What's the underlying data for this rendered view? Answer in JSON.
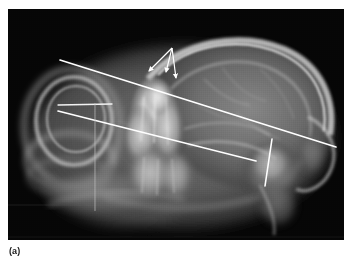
{
  "figure": {
    "caption_label": "(a)",
    "modality": "radiograph",
    "plate": {
      "x": 8,
      "y": 9,
      "width": 336,
      "height": 231,
      "background_color": "#050505",
      "bone_color": "#d9d9d9",
      "soft_tissue_color": "#6a6a6a"
    },
    "page_background_color": "#ffffff"
  },
  "annotations": {
    "overlay_color": "#ffffff",
    "measurement_lines": [
      {
        "name": "upper-reference-line",
        "x1": 60,
        "y1": 60,
        "x2": 336,
        "y2": 147,
        "stroke_width": 1.7,
        "color": "#ffffff"
      },
      {
        "name": "lower-reference-line",
        "x1": 58,
        "y1": 111,
        "x2": 256,
        "y2": 161,
        "stroke_width": 1.7,
        "color": "#ffffff"
      },
      {
        "name": "horizontal-baseline",
        "x1": 58,
        "y1": 105,
        "x2": 112,
        "y2": 104,
        "stroke_width": 1.3,
        "color": "#f2f2f2"
      },
      {
        "name": "vertical-caliper-line",
        "x1": 95,
        "y1": 103,
        "x2": 95,
        "y2": 211,
        "stroke_width": 0.9,
        "color": "#bdbdbd"
      },
      {
        "name": "posterior-oblique-marker",
        "x1": 272,
        "y1": 139,
        "x2": 265,
        "y2": 186,
        "stroke_width": 1.6,
        "color": "#ffffff"
      }
    ],
    "arrows": [
      {
        "name": "arrow-left",
        "from_x": 172,
        "from_y": 48,
        "to_x": 147,
        "to_y": 72,
        "color": "#ffffff"
      },
      {
        "name": "arrow-center",
        "from_x": 172,
        "from_y": 48,
        "to_x": 166,
        "to_y": 73,
        "color": "#ffffff"
      },
      {
        "name": "arrow-right",
        "from_x": 172,
        "from_y": 48,
        "to_x": 175,
        "to_y": 79,
        "color": "#ffffff"
      }
    ],
    "arrow_count": 3,
    "arrow_origin": {
      "x": 172,
      "y": 48
    }
  },
  "anatomy": {
    "regions": [
      {
        "name": "cranial-vault",
        "label": "cranial vault"
      },
      {
        "name": "auditory-bulla-ring",
        "label": "auditory bulla"
      },
      {
        "name": "dental-arcade",
        "label": "dental arcade"
      },
      {
        "name": "nasal-rostrum",
        "label": "rostrum"
      },
      {
        "name": "mandible",
        "label": "mandible"
      },
      {
        "name": "occipital-region",
        "label": "occipital region"
      }
    ]
  }
}
